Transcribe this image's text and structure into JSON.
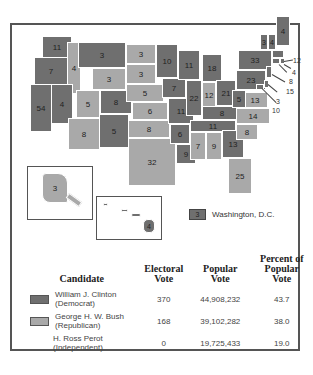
{
  "colors": {
    "democrat": "#6f6f6f",
    "republican": "#a9a9a9",
    "border": "#ffffff",
    "frame": "#555555"
  },
  "states": [
    {
      "abbr": "WA",
      "ev": "11",
      "party": "d"
    },
    {
      "abbr": "OR",
      "ev": "7",
      "party": "d"
    },
    {
      "abbr": "CA",
      "ev": "54",
      "party": "d"
    },
    {
      "abbr": "ID",
      "ev": "4",
      "party": "r"
    },
    {
      "abbr": "NV",
      "ev": "4",
      "party": "d"
    },
    {
      "abbr": "MT",
      "ev": "3",
      "party": "d"
    },
    {
      "abbr": "WY",
      "ev": "3",
      "party": "r"
    },
    {
      "abbr": "UT",
      "ev": "5",
      "party": "r"
    },
    {
      "abbr": "AZ",
      "ev": "8",
      "party": "r"
    },
    {
      "abbr": "CO",
      "ev": "8",
      "party": "d"
    },
    {
      "abbr": "NM",
      "ev": "5",
      "party": "d"
    },
    {
      "abbr": "ND",
      "ev": "3",
      "party": "r"
    },
    {
      "abbr": "SD",
      "ev": "3",
      "party": "r"
    },
    {
      "abbr": "NE",
      "ev": "5",
      "party": "r"
    },
    {
      "abbr": "KS",
      "ev": "6",
      "party": "r"
    },
    {
      "abbr": "OK",
      "ev": "8",
      "party": "r"
    },
    {
      "abbr": "TX",
      "ev": "32",
      "party": "r"
    },
    {
      "abbr": "MN",
      "ev": "10",
      "party": "d"
    },
    {
      "abbr": "IA",
      "ev": "7",
      "party": "d"
    },
    {
      "abbr": "MO",
      "ev": "11",
      "party": "d"
    },
    {
      "abbr": "AR",
      "ev": "6",
      "party": "d"
    },
    {
      "abbr": "LA",
      "ev": "9",
      "party": "d"
    },
    {
      "abbr": "WI",
      "ev": "11",
      "party": "d"
    },
    {
      "abbr": "IL",
      "ev": "22",
      "party": "d"
    },
    {
      "abbr": "MI",
      "ev": "18",
      "party": "d"
    },
    {
      "abbr": "IN",
      "ev": "12",
      "party": "r"
    },
    {
      "abbr": "OH",
      "ev": "21",
      "party": "d"
    },
    {
      "abbr": "KY",
      "ev": "8",
      "party": "d"
    },
    {
      "abbr": "TN",
      "ev": "11",
      "party": "d"
    },
    {
      "abbr": "MS",
      "ev": "7",
      "party": "r"
    },
    {
      "abbr": "AL",
      "ev": "9",
      "party": "r"
    },
    {
      "abbr": "GA",
      "ev": "13",
      "party": "d"
    },
    {
      "abbr": "FL",
      "ev": "25",
      "party": "r"
    },
    {
      "abbr": "SC",
      "ev": "8",
      "party": "r"
    },
    {
      "abbr": "NC",
      "ev": "14",
      "party": "r"
    },
    {
      "abbr": "VA",
      "ev": "13",
      "party": "r"
    },
    {
      "abbr": "WV",
      "ev": "5",
      "party": "d"
    },
    {
      "abbr": "PA",
      "ev": "23",
      "party": "d"
    },
    {
      "abbr": "NY",
      "ev": "33",
      "party": "d"
    },
    {
      "abbr": "VT",
      "ev": "3",
      "party": "d"
    },
    {
      "abbr": "NH",
      "ev": "4",
      "party": "d"
    },
    {
      "abbr": "ME",
      "ev": "4",
      "party": "d"
    },
    {
      "abbr": "MA",
      "ev": "12",
      "party": "d"
    },
    {
      "abbr": "RI",
      "ev": "4",
      "party": "d"
    },
    {
      "abbr": "CT",
      "ev": "8",
      "party": "d"
    },
    {
      "abbr": "NJ",
      "ev": "15",
      "party": "d"
    },
    {
      "abbr": "DE",
      "ev": "3",
      "party": "d"
    },
    {
      "abbr": "MD",
      "ev": "10",
      "party": "d"
    },
    {
      "abbr": "AK",
      "ev": "3",
      "party": "r"
    },
    {
      "abbr": "HI",
      "ev": "4",
      "party": "d"
    }
  ],
  "dc": {
    "ev": "3",
    "label": "Washington, D.C."
  },
  "table": {
    "headers": {
      "candidate": "Candidate",
      "electoral_1": "Electoral",
      "electoral_2": "Vote",
      "popular_1": "Popular",
      "popular_2": "Vote",
      "percent_1": "Percent of",
      "percent_2": "Popular Vote"
    },
    "rows": [
      {
        "name": "William J. Clinton",
        "party": "(Democrat)",
        "electoral": "370",
        "popular": "44,908,232",
        "percent": "43.7"
      },
      {
        "name": "George H. W. Bush",
        "party": "(Republican)",
        "electoral": "168",
        "popular": "39,102,282",
        "percent": "38.0"
      },
      {
        "name": "H. Ross Perot",
        "party": "(Independent)",
        "electoral": "0",
        "popular": "19,725,433",
        "percent": "19.0"
      }
    ]
  }
}
